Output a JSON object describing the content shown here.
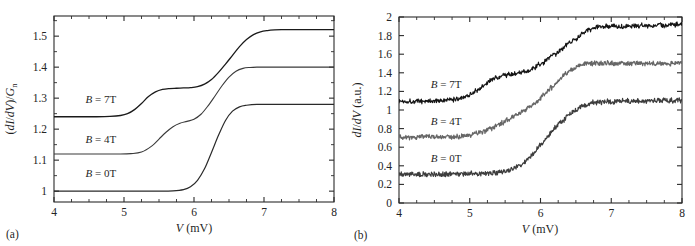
{
  "figure": {
    "panels": [
      {
        "id": "a",
        "panel_label": "(a)",
        "xlabel_italic": "V",
        "xlabel_unit": " (mV)",
        "ylabel": "(dI/dV)/G",
        "ylabel_sub": "n",
        "curve_labels": [
          {
            "b": "B",
            "eq": " = 7T"
          },
          {
            "b": "B",
            "eq": " = 4T"
          },
          {
            "b": "B",
            "eq": " = 0T"
          }
        ]
      },
      {
        "id": "b",
        "panel_label": "(b)",
        "xlabel_italic": "V",
        "xlabel_unit": " (mV)",
        "ylabel": "dI/dV",
        "ylabel_unit": " (a.u.)",
        "curve_labels": [
          {
            "b": "B",
            "eq": " = 7T"
          },
          {
            "b": "B",
            "eq": " = 4T"
          },
          {
            "b": "B",
            "eq": " = 0T"
          }
        ]
      }
    ]
  },
  "chart_data": [
    {
      "panel": "a",
      "type": "line",
      "title": "",
      "xlabel": "V (mV)",
      "ylabel": "(dI/dV)/G_n",
      "xlim": [
        4,
        8
      ],
      "ylim": [
        0.965,
        1.565
      ],
      "xticks": [
        4,
        5,
        6,
        7,
        8
      ],
      "xtick_labels": [
        "4",
        "5",
        "6",
        "7",
        "8"
      ],
      "xticks_minor": [
        4.25,
        4.5,
        4.75,
        5.25,
        5.5,
        5.75,
        6.25,
        6.5,
        6.75,
        7.25,
        7.5,
        7.75
      ],
      "yticks": [
        1,
        1.1,
        1.2,
        1.3,
        1.4,
        1.5
      ],
      "ytick_labels": [
        "1",
        "1.1",
        "1.2",
        "1.3",
        "1.4",
        "1.5"
      ],
      "yticks_minor": [
        1.05,
        1.15,
        1.25,
        1.35,
        1.45,
        1.55
      ],
      "grid": false,
      "legend_position": "inline-left",
      "noise": false,
      "series": [
        {
          "name": "B = 7T",
          "color": "#1a1a1a",
          "linewidth": 1.3,
          "label_x": 4.45,
          "label_y": 1.285,
          "x": [
            4.0,
            4.2,
            4.4,
            4.6,
            4.8,
            4.95,
            5.05,
            5.15,
            5.25,
            5.35,
            5.45,
            5.55,
            5.65,
            5.75,
            5.85,
            5.95,
            6.05,
            6.15,
            6.25,
            6.35,
            6.45,
            6.55,
            6.65,
            6.75,
            6.85,
            6.95,
            7.05,
            7.15,
            7.25,
            7.4,
            7.6,
            7.8,
            8.0
          ],
          "y": [
            1.24,
            1.24,
            1.24,
            1.24,
            1.241,
            1.244,
            1.25,
            1.263,
            1.283,
            1.305,
            1.32,
            1.328,
            1.331,
            1.332,
            1.333,
            1.334,
            1.337,
            1.345,
            1.36,
            1.383,
            1.41,
            1.438,
            1.466,
            1.489,
            1.505,
            1.514,
            1.518,
            1.52,
            1.521,
            1.521,
            1.521,
            1.521,
            1.521
          ]
        },
        {
          "name": "B = 4T",
          "color": "#3a3a3a",
          "linewidth": 1.1,
          "label_x": 4.45,
          "label_y": 1.155,
          "x": [
            4.0,
            4.3,
            4.6,
            4.9,
            5.1,
            5.25,
            5.4,
            5.5,
            5.6,
            5.7,
            5.8,
            5.9,
            6.0,
            6.1,
            6.2,
            6.3,
            6.4,
            6.5,
            6.6,
            6.7,
            6.8,
            6.9,
            7.0,
            7.2,
            7.5,
            7.8,
            8.0
          ],
          "y": [
            1.12,
            1.12,
            1.12,
            1.12,
            1.121,
            1.126,
            1.146,
            1.168,
            1.19,
            1.208,
            1.219,
            1.225,
            1.232,
            1.248,
            1.275,
            1.307,
            1.34,
            1.368,
            1.387,
            1.396,
            1.399,
            1.4,
            1.4,
            1.4,
            1.4,
            1.4,
            1.4
          ]
        },
        {
          "name": "B = 0T",
          "color": "#2a2a2a",
          "linewidth": 1.2,
          "label_x": 4.45,
          "label_y": 1.045,
          "x": [
            4.0,
            4.4,
            4.8,
            5.2,
            5.5,
            5.7,
            5.85,
            5.95,
            6.05,
            6.15,
            6.25,
            6.35,
            6.45,
            6.55,
            6.65,
            6.75,
            6.9,
            7.1,
            7.4,
            7.7,
            8.0
          ],
          "y": [
            1.0,
            1.0,
            1.0,
            1.0,
            1.0,
            1.001,
            1.005,
            1.014,
            1.035,
            1.072,
            1.125,
            1.18,
            1.228,
            1.258,
            1.272,
            1.277,
            1.28,
            1.28,
            1.28,
            1.28,
            1.28
          ]
        }
      ]
    },
    {
      "panel": "b",
      "type": "line",
      "title": "",
      "xlabel": "V (mV)",
      "ylabel": "dI/dV (a.u.)",
      "xlim": [
        4,
        8
      ],
      "ylim": [
        0,
        2
      ],
      "xticks": [
        4,
        5,
        6,
        7,
        8
      ],
      "xtick_labels": [
        "4",
        "5",
        "6",
        "7",
        "8"
      ],
      "xticks_minor": [
        4.25,
        4.5,
        4.75,
        5.25,
        5.5,
        5.75,
        6.25,
        6.5,
        6.75,
        7.25,
        7.5,
        7.75
      ],
      "yticks": [
        0,
        0.2,
        0.4,
        0.6,
        0.8,
        1.0,
        1.2,
        1.4,
        1.6,
        1.8,
        2.0
      ],
      "ytick_labels": [
        "0",
        "0.2",
        "0.4",
        "0.6",
        "0.8",
        "1",
        "1.2",
        "1.4",
        "1.6",
        "1.8",
        "2"
      ],
      "grid": false,
      "legend_position": "inline-left",
      "noise": true,
      "noise_amplitude": 0.022,
      "series": [
        {
          "name": "B = 7T",
          "color": "#141414",
          "linewidth": 1.1,
          "label_x": 4.45,
          "label_y": 1.235,
          "x": [
            4.0,
            4.2,
            4.4,
            4.6,
            4.75,
            4.9,
            5.0,
            5.1,
            5.2,
            5.3,
            5.4,
            5.5,
            5.6,
            5.7,
            5.8,
            5.9,
            6.0,
            6.1,
            6.2,
            6.3,
            6.4,
            6.5,
            6.6,
            6.7,
            6.8,
            6.9,
            7.0,
            7.1,
            7.25,
            7.5,
            7.75,
            8.0
          ],
          "y": [
            1.095,
            1.095,
            1.095,
            1.1,
            1.11,
            1.135,
            1.165,
            1.21,
            1.265,
            1.32,
            1.355,
            1.375,
            1.385,
            1.395,
            1.415,
            1.45,
            1.495,
            1.545,
            1.6,
            1.655,
            1.71,
            1.77,
            1.825,
            1.868,
            1.89,
            1.898,
            1.9,
            1.903,
            1.905,
            1.908,
            1.912,
            1.918
          ]
        },
        {
          "name": "B = 4T",
          "color": "#666666",
          "linewidth": 1.2,
          "label_x": 4.45,
          "label_y": 0.835,
          "x": [
            4.0,
            4.25,
            4.5,
            4.7,
            4.85,
            5.0,
            5.15,
            5.3,
            5.45,
            5.55,
            5.65,
            5.75,
            5.85,
            5.95,
            6.05,
            6.15,
            6.25,
            6.35,
            6.45,
            6.55,
            6.65,
            6.75,
            6.9,
            7.1,
            7.35,
            7.6,
            7.85,
            8.0
          ],
          "y": [
            0.71,
            0.708,
            0.71,
            0.712,
            0.718,
            0.73,
            0.755,
            0.8,
            0.86,
            0.905,
            0.945,
            0.985,
            1.035,
            1.095,
            1.165,
            1.24,
            1.315,
            1.385,
            1.44,
            1.478,
            1.495,
            1.5,
            1.503,
            1.502,
            1.5,
            1.502,
            1.503,
            1.505
          ]
        },
        {
          "name": "B = 0T",
          "color": "#3d3d3d",
          "linewidth": 1.2,
          "label_x": 4.45,
          "label_y": 0.445,
          "x": [
            4.0,
            4.3,
            4.6,
            4.9,
            5.1,
            5.3,
            5.45,
            5.6,
            5.7,
            5.8,
            5.9,
            6.0,
            6.1,
            6.2,
            6.3,
            6.4,
            6.5,
            6.6,
            6.75,
            6.95,
            7.2,
            7.5,
            7.75,
            8.0
          ],
          "y": [
            0.31,
            0.308,
            0.31,
            0.312,
            0.315,
            0.322,
            0.335,
            0.365,
            0.4,
            0.455,
            0.53,
            0.625,
            0.72,
            0.805,
            0.88,
            0.945,
            1.0,
            1.045,
            1.078,
            1.09,
            1.095,
            1.098,
            1.1,
            1.105
          ]
        }
      ]
    }
  ]
}
